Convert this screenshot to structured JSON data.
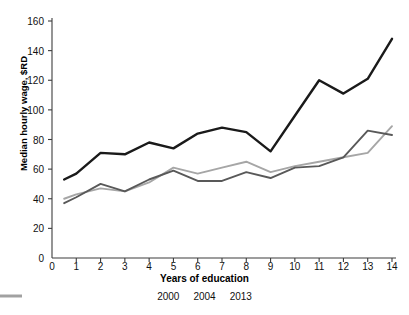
{
  "chart_data": {
    "type": "line",
    "title": "",
    "xlabel": "Years of education",
    "ylabel": "Median hourly wage, $RD",
    "xlim": [
      0,
      14
    ],
    "ylim": [
      0,
      160
    ],
    "grid": false,
    "legend_position": "bottom",
    "x": [
      0.5,
      1,
      2,
      3,
      4,
      5,
      6,
      7,
      8,
      9,
      10,
      11,
      12,
      13,
      14
    ],
    "xticks": [
      "0",
      "1",
      "2",
      "3",
      "4",
      "5",
      "6",
      "7",
      "8",
      "9",
      "10",
      "11",
      "12",
      "13",
      "14"
    ],
    "yticks": [
      "0",
      "20",
      "40",
      "60",
      "80",
      "100",
      "120",
      "140",
      "160"
    ],
    "series": [
      {
        "name": "2000",
        "color": "#1a1a1a",
        "width": 2.4,
        "values": [
          53,
          57,
          71,
          70,
          78,
          74,
          84,
          88,
          85,
          72,
          96,
          120,
          111,
          121,
          148
        ]
      },
      {
        "name": "2004",
        "color": "#595959",
        "width": 1.9,
        "values": [
          37,
          41,
          50,
          45,
          53,
          59,
          52,
          52,
          58,
          54,
          61,
          62,
          68,
          86,
          83
        ]
      },
      {
        "name": "2013",
        "color": "#a6a6a6",
        "width": 1.9,
        "values": [
          40,
          43,
          47,
          45,
          51,
          61,
          57,
          61,
          65,
          58,
          62,
          65,
          68,
          71,
          89
        ]
      }
    ]
  },
  "legend": {
    "items": [
      {
        "label": "2000"
      },
      {
        "label": "2004"
      },
      {
        "label": "2013"
      }
    ]
  },
  "axes": {
    "axis_color": "#3d3d3d"
  }
}
